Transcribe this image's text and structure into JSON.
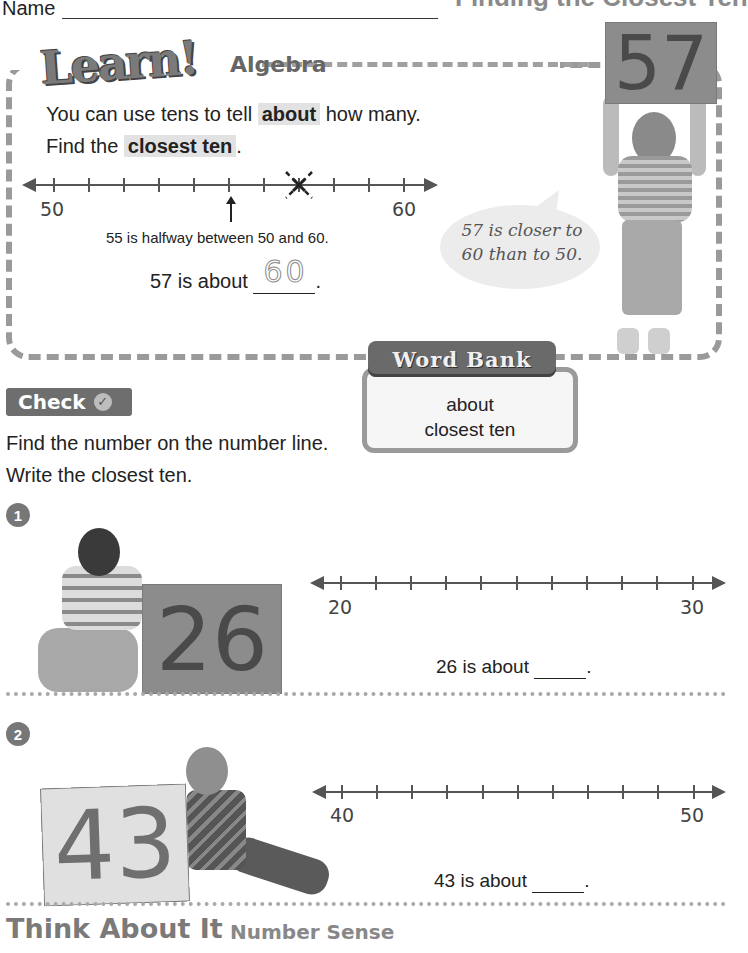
{
  "header": {
    "name_label": "Name",
    "page_title": "Finding the Closest Ten"
  },
  "learn": {
    "logo": "Learn!",
    "tag": "Algebra",
    "line1_before": "You can use tens to tell",
    "line1_highlight": "about",
    "line1_after": "how many.",
    "line2_before": "Find the",
    "line2_highlight": "closest ten",
    "line2_after": ".",
    "number_line": {
      "start_label": "50",
      "end_label": "60",
      "start": 50,
      "end": 60,
      "marked_value": 57,
      "arrow_value": 55
    },
    "halfway_text": "55 is halfway between 50 and 60.",
    "about_prefix": "57 is about",
    "about_answer": "60",
    "about_suffix": ".",
    "sign_number": "57",
    "speech_bubble": "57 is closer to 60 than to 50."
  },
  "word_bank": {
    "title": "Word Bank",
    "words": [
      "about",
      "closest ten"
    ]
  },
  "check": {
    "badge_label": "Check",
    "instruction_line1": "Find the number on the number line.",
    "instruction_line2": "Write the closest ten.",
    "problems": [
      {
        "number": "1",
        "sign_number": "26",
        "start_label": "20",
        "end_label": "30",
        "prompt_prefix": "26 is about",
        "prompt_suffix": "."
      },
      {
        "number": "2",
        "sign_number": "43",
        "start_label": "40",
        "end_label": "50",
        "prompt_prefix": "43 is about",
        "prompt_suffix": "."
      }
    ]
  },
  "think": {
    "title": "Think About It",
    "subtitle": "Number Sense"
  },
  "colors": {
    "highlight": "#e2e2e2",
    "accent_gray": "#6e6e6e",
    "border_gray": "#9a9a9a"
  }
}
